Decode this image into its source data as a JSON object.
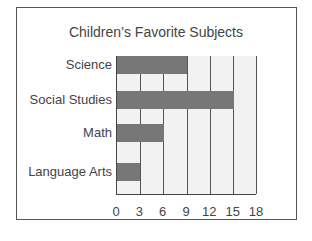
{
  "chart_data": {
    "type": "bar",
    "orientation": "horizontal",
    "title": "Children’s Favorite Subjects",
    "categories": [
      "Science",
      "Social Studies",
      "Math",
      "Language Arts"
    ],
    "values": [
      9,
      15,
      6,
      3
    ],
    "xlabel": "",
    "ylabel": "",
    "xlim": [
      0,
      18
    ],
    "xticks": [
      "0",
      "3",
      "6",
      "9",
      "12",
      "15",
      "18"
    ],
    "grid": true,
    "bar_color": "#777777"
  }
}
